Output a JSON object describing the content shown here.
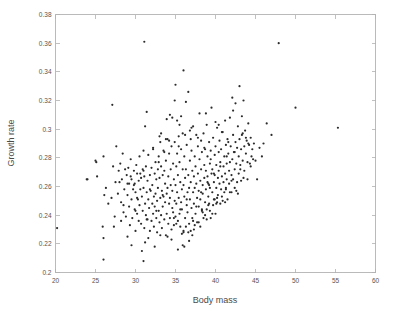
{
  "figure": {
    "background_color": "#ffffff",
    "frame_color": "#b2b2b2",
    "point_color": "#2b2b2b"
  },
  "chart_data": {
    "type": "scatter",
    "title": "",
    "subtitle": "",
    "xlabel": "Body mass",
    "ylabel": "Growth rate",
    "xlim": [
      20,
      60
    ],
    "ylim": [
      0.2,
      0.38
    ],
    "xticks": [
      20,
      25,
      30,
      35,
      40,
      45,
      50,
      55,
      60
    ],
    "xtick_labels": [
      "20",
      "25",
      "30",
      "35",
      "40",
      "45",
      "50",
      "55",
      "60"
    ],
    "yticks": [
      0.2,
      0.22,
      0.24,
      0.26,
      0.28,
      0.3,
      0.32,
      0.34,
      0.36,
      0.38
    ],
    "ytick_labels": [
      "0.2",
      "0.22",
      "0.24",
      "0.26",
      "0.28",
      "0.3",
      "0.32",
      "0.34",
      "0.36",
      "0.38"
    ],
    "grid": false,
    "legend": null,
    "legend_position": "none",
    "marker": "dot",
    "marker_size": 1.1,
    "n_points": 452,
    "annotations": [],
    "x": [
      23.9,
      25.0,
      25.1,
      25.2,
      25.9,
      26.0,
      26.0,
      26.1,
      26.3,
      26.6,
      27.1,
      27.2,
      27.3,
      27.4,
      27.5,
      27.6,
      27.8,
      27.9,
      28.0,
      28.1,
      28.2,
      28.3,
      28.4,
      28.5,
      28.6,
      28.7,
      28.8,
      28.9,
      29.0,
      29.0,
      29.1,
      29.2,
      29.2,
      29.3,
      29.4,
      29.5,
      29.5,
      29.6,
      29.7,
      29.8,
      29.9,
      29.9,
      30.0,
      30.0,
      30.1,
      30.2,
      30.2,
      30.3,
      30.4,
      30.4,
      30.5,
      30.5,
      30.6,
      30.7,
      30.7,
      30.8,
      30.9,
      30.9,
      31.0,
      31.0,
      31.0,
      31.1,
      31.1,
      31.2,
      31.2,
      31.3,
      31.3,
      31.4,
      31.4,
      31.5,
      31.5,
      31.6,
      31.6,
      31.7,
      31.8,
      31.8,
      31.9,
      32.0,
      32.0,
      32.1,
      32.1,
      32.2,
      32.2,
      32.3,
      32.3,
      32.4,
      32.4,
      32.5,
      32.5,
      32.6,
      32.6,
      32.7,
      32.7,
      32.8,
      32.8,
      32.9,
      32.9,
      33.0,
      33.0,
      33.1,
      33.1,
      33.2,
      33.2,
      33.3,
      33.3,
      33.4,
      33.4,
      33.5,
      33.5,
      33.6,
      33.6,
      33.7,
      33.7,
      33.8,
      33.8,
      33.9,
      33.9,
      34.0,
      34.0,
      34.1,
      34.1,
      34.2,
      34.2,
      34.3,
      34.3,
      34.4,
      34.4,
      34.5,
      34.5,
      34.6,
      34.6,
      34.7,
      34.7,
      34.8,
      34.8,
      34.9,
      34.9,
      35.0,
      35.0,
      35.0,
      35.1,
      35.1,
      35.2,
      35.2,
      35.3,
      35.3,
      35.4,
      35.4,
      35.5,
      35.5,
      35.6,
      35.6,
      35.7,
      35.7,
      35.8,
      35.8,
      35.9,
      35.9,
      36.0,
      36.0,
      36.0,
      36.1,
      36.1,
      36.2,
      36.2,
      36.3,
      36.3,
      36.4,
      36.4,
      36.5,
      36.5,
      36.6,
      36.6,
      36.7,
      36.7,
      36.8,
      36.8,
      36.9,
      36.9,
      37.0,
      37.0,
      37.1,
      37.1,
      37.2,
      37.2,
      37.3,
      37.3,
      37.4,
      37.4,
      37.5,
      37.5,
      37.6,
      37.6,
      37.7,
      37.7,
      37.8,
      37.8,
      37.9,
      37.9,
      38.0,
      38.0,
      38.1,
      38.1,
      38.2,
      38.2,
      38.3,
      38.3,
      38.4,
      38.4,
      38.5,
      38.5,
      38.6,
      38.6,
      38.7,
      38.7,
      38.8,
      38.8,
      38.9,
      38.9,
      39.0,
      39.0,
      39.1,
      39.1,
      39.2,
      39.2,
      39.3,
      39.3,
      39.4,
      39.4,
      39.5,
      39.5,
      39.6,
      39.6,
      39.7,
      39.7,
      39.8,
      39.8,
      39.9,
      39.9,
      40.0,
      40.0,
      40.1,
      40.1,
      40.2,
      40.2,
      40.3,
      40.3,
      40.4,
      40.4,
      40.5,
      40.5,
      40.6,
      40.6,
      40.7,
      40.7,
      40.8,
      40.8,
      40.9,
      41.0,
      41.0,
      41.1,
      41.1,
      41.2,
      41.2,
      41.3,
      41.3,
      41.4,
      41.4,
      41.5,
      41.5,
      41.6,
      41.7,
      41.7,
      41.8,
      41.8,
      41.9,
      42.0,
      42.0,
      42.1,
      42.1,
      42.2,
      42.2,
      42.3,
      42.4,
      42.4,
      42.5,
      42.5,
      42.6,
      42.7,
      42.7,
      42.8,
      42.9,
      42.9,
      43.0,
      43.0,
      43.1,
      43.2,
      43.2,
      43.3,
      43.4,
      43.4,
      43.5,
      43.6,
      43.6,
      43.7,
      43.8,
      43.9,
      44.0,
      44.0,
      44.1,
      44.2,
      44.3,
      44.4,
      44.5,
      44.6,
      44.7,
      44.8,
      45.0,
      45.2,
      45.5,
      46.0,
      46.4,
      47.0,
      47.9,
      50.0,
      55.3,
      30.8,
      31.2,
      35.9,
      36.0,
      26.0,
      31.1,
      24.0,
      20.2,
      29.5,
      33.1,
      34.5,
      35.1,
      36.6,
      37.2,
      38.4,
      39.1,
      40.2,
      41.3,
      42.0,
      43.1,
      28.5,
      29.8,
      30.6,
      31.8,
      32.9,
      33.6,
      34.2,
      35.4,
      36.2,
      37.0,
      37.8,
      38.6,
      39.4,
      40.0,
      40.8,
      41.6,
      42.4,
      43.3,
      44.1,
      34.0,
      34.8,
      35.6,
      36.4,
      37.6,
      38.2,
      39.0,
      39.8,
      40.6,
      41.4,
      33.4,
      32.6,
      31.4,
      30.2,
      29.0,
      35.2,
      36.8,
      38.8,
      40.4,
      42.2,
      43.8,
      33.8,
      32.2,
      31.0,
      35.8,
      37.4,
      39.6,
      41.2,
      42.8,
      34.6,
      33.2,
      36.1,
      38.1,
      39.3,
      40.9,
      42.6,
      35.5,
      34.3,
      33.0,
      37.3,
      38.9,
      36.7,
      35.3,
      34.9,
      38.3,
      39.9,
      37.1,
      36.3,
      35.7,
      38.7,
      40.1,
      37.9,
      36.9,
      41.8,
      39.2,
      30.0,
      28.2,
      27.0,
      29.4,
      31.6,
      32.4,
      33.9,
      43.5,
      44.4,
      45.8
    ],
    "y": [
      0.265,
      0.278,
      0.277,
      0.267,
      0.232,
      0.224,
      0.281,
      0.254,
      0.259,
      0.248,
      0.317,
      0.274,
      0.232,
      0.239,
      0.263,
      0.288,
      0.255,
      0.271,
      0.263,
      0.276,
      0.249,
      0.265,
      0.283,
      0.242,
      0.258,
      0.272,
      0.239,
      0.268,
      0.225,
      0.254,
      0.273,
      0.246,
      0.262,
      0.233,
      0.279,
      0.251,
      0.265,
      0.238,
      0.258,
      0.271,
      0.244,
      0.262,
      0.229,
      0.256,
      0.275,
      0.241,
      0.269,
      0.251,
      0.236,
      0.264,
      0.247,
      0.281,
      0.258,
      0.234,
      0.266,
      0.253,
      0.243,
      0.272,
      0.208,
      0.259,
      0.285,
      0.231,
      0.267,
      0.248,
      0.302,
      0.24,
      0.274,
      0.256,
      0.312,
      0.237,
      0.264,
      0.251,
      0.282,
      0.245,
      0.229,
      0.268,
      0.257,
      0.236,
      0.273,
      0.248,
      0.261,
      0.241,
      0.287,
      0.253,
      0.232,
      0.269,
      0.246,
      0.277,
      0.255,
      0.238,
      0.265,
      0.25,
      0.228,
      0.272,
      0.259,
      0.243,
      0.281,
      0.235,
      0.266,
      0.252,
      0.291,
      0.24,
      0.274,
      0.257,
      0.231,
      0.268,
      0.246,
      0.285,
      0.253,
      0.237,
      0.271,
      0.249,
      0.262,
      0.226,
      0.278,
      0.255,
      0.241,
      0.293,
      0.259,
      0.234,
      0.267,
      0.248,
      0.283,
      0.252,
      0.238,
      0.272,
      0.261,
      0.23,
      0.288,
      0.245,
      0.257,
      0.242,
      0.276,
      0.265,
      0.233,
      0.291,
      0.25,
      0.261,
      0.239,
      0.331,
      0.274,
      0.248,
      0.283,
      0.256,
      0.236,
      0.268,
      0.295,
      0.252,
      0.241,
      0.277,
      0.263,
      0.232,
      0.286,
      0.249,
      0.258,
      0.244,
      0.272,
      0.297,
      0.229,
      0.261,
      0.341,
      0.253,
      0.281,
      0.266,
      0.238,
      0.319,
      0.272,
      0.247,
      0.289,
      0.256,
      0.242,
      0.326,
      0.268,
      0.259,
      0.234,
      0.278,
      0.251,
      0.293,
      0.263,
      0.245,
      0.285,
      0.271,
      0.238,
      0.256,
      0.302,
      0.267,
      0.248,
      0.281,
      0.259,
      0.274,
      0.241,
      0.296,
      0.262,
      0.252,
      0.235,
      0.288,
      0.269,
      0.257,
      0.246,
      0.279,
      0.311,
      0.264,
      0.251,
      0.292,
      0.272,
      0.243,
      0.284,
      0.261,
      0.255,
      0.238,
      0.297,
      0.275,
      0.266,
      0.249,
      0.286,
      0.258,
      0.271,
      0.244,
      0.303,
      0.267,
      0.281,
      0.253,
      0.262,
      0.291,
      0.248,
      0.276,
      0.259,
      0.238,
      0.285,
      0.269,
      0.315,
      0.256,
      0.272,
      0.247,
      0.294,
      0.263,
      0.251,
      0.282,
      0.268,
      0.241,
      0.288,
      0.275,
      0.259,
      0.249,
      0.301,
      0.266,
      0.254,
      0.284,
      0.271,
      0.262,
      0.292,
      0.248,
      0.277,
      0.258,
      0.286,
      0.267,
      0.253,
      0.298,
      0.274,
      0.263,
      0.281,
      0.256,
      0.306,
      0.269,
      0.289,
      0.259,
      0.276,
      0.265,
      0.293,
      0.251,
      0.283,
      0.271,
      0.262,
      0.308,
      0.277,
      0.288,
      0.268,
      0.256,
      0.322,
      0.279,
      0.265,
      0.296,
      0.284,
      0.272,
      0.259,
      0.291,
      0.318,
      0.276,
      0.287,
      0.263,
      0.302,
      0.281,
      0.269,
      0.33,
      0.293,
      0.275,
      0.286,
      0.264,
      0.309,
      0.297,
      0.278,
      0.32,
      0.288,
      0.271,
      0.299,
      0.283,
      0.292,
      0.277,
      0.265,
      0.304,
      0.289,
      0.276,
      0.294,
      0.281,
      0.286,
      0.279,
      0.29,
      0.278,
      0.265,
      0.287,
      0.29,
      0.304,
      0.296,
      0.36,
      0.315,
      0.301,
      0.215,
      0.221,
      0.219,
      0.228,
      0.209,
      0.361,
      0.265,
      0.231,
      0.219,
      0.226,
      0.223,
      0.234,
      0.228,
      0.236,
      0.242,
      0.247,
      0.252,
      0.258,
      0.264,
      0.272,
      0.247,
      0.261,
      0.269,
      0.258,
      0.277,
      0.284,
      0.292,
      0.288,
      0.296,
      0.301,
      0.294,
      0.287,
      0.279,
      0.305,
      0.298,
      0.291,
      0.284,
      0.296,
      0.29,
      0.225,
      0.238,
      0.244,
      0.251,
      0.246,
      0.256,
      0.263,
      0.269,
      0.274,
      0.281,
      0.254,
      0.243,
      0.237,
      0.252,
      0.262,
      0.306,
      0.299,
      0.311,
      0.303,
      0.313,
      0.294,
      0.293,
      0.286,
      0.271,
      0.227,
      0.233,
      0.241,
      0.249,
      0.255,
      0.308,
      0.297,
      0.218,
      0.232,
      0.243,
      0.25,
      0.257,
      0.303,
      0.31,
      0.295,
      0.23,
      0.237,
      0.222,
      0.216,
      0.32,
      0.244,
      0.251,
      0.226,
      0.232,
      0.309,
      0.24,
      0.248,
      0.235,
      0.229,
      0.256,
      0.261,
      0.243,
      0.236,
      0.252,
      0.267,
      0.224,
      0.218,
      0.307,
      0.266,
      0.274,
      0.281
    ]
  }
}
